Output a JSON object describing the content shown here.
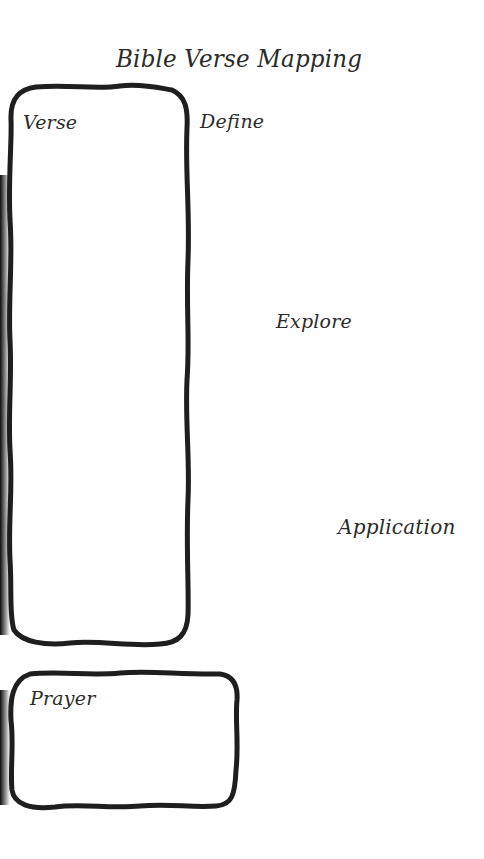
{
  "document": {
    "title": "Bible Verse Mapping",
    "sections": {
      "verse": {
        "label": "Verse",
        "value": ""
      },
      "define": {
        "label": "Define",
        "value": ""
      },
      "explore": {
        "label": "Explore",
        "value": ""
      },
      "application": {
        "label": "Application",
        "value": ""
      },
      "prayer": {
        "label": "Prayer",
        "value": ""
      }
    }
  },
  "colors": {
    "background": "#ffffff",
    "outline": "#1e1e1e",
    "text": "#2b2b2b"
  }
}
